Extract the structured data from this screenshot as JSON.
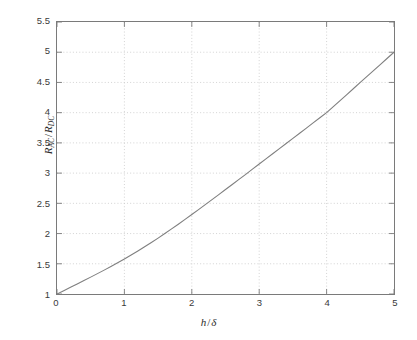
{
  "chart_data": {
    "type": "line",
    "title": "",
    "subtitle": "",
    "xlabel": "h / δ",
    "ylabel": "R_AC / R_DC",
    "xlabel_parts": {
      "var": "h",
      "slash": "/",
      "denom": "δ"
    },
    "ylabel_parts": {
      "num_base": "R",
      "num_sub": "AC",
      "slash": "/",
      "den_base": "R",
      "den_sub": "DC"
    },
    "xlim": [
      0,
      5
    ],
    "ylim": [
      1,
      5.5
    ],
    "xticks": [
      0,
      1,
      2,
      3,
      4,
      5
    ],
    "xtick_labels": [
      "0",
      "1",
      "2",
      "3",
      "4",
      "5"
    ],
    "yticks": [
      1,
      1.5,
      2,
      2.5,
      3,
      3.5,
      4,
      4.5,
      5,
      5.5
    ],
    "ytick_labels": [
      "1",
      "1.5",
      "2",
      "2.5",
      "3",
      "3.5",
      "4",
      "4.5",
      "5",
      "5.5"
    ],
    "grid": true,
    "grid_style": "dotted",
    "legend": null,
    "legend_position": "none",
    "series": [
      {
        "name": "R_AC/R_DC vs h/delta",
        "color": "#7f7f7f",
        "linewidth": 1.1,
        "x": [
          0.0,
          0.1,
          0.2,
          0.3,
          0.4,
          0.5,
          0.6,
          0.7,
          0.8,
          0.9,
          1.0,
          1.1,
          1.2,
          1.3,
          1.4,
          1.5,
          1.6,
          1.7,
          1.8,
          1.9,
          2.0,
          2.1,
          2.2,
          2.3,
          2.4,
          2.5,
          2.6,
          2.7,
          2.8,
          2.9,
          3.0,
          3.1,
          3.2,
          3.3,
          3.4,
          3.5,
          3.6,
          3.7,
          3.8,
          3.9,
          4.0,
          4.1,
          4.2,
          4.3,
          4.4,
          4.5,
          4.6,
          4.7,
          4.8,
          4.9,
          5.0
        ],
        "y": [
          1.0,
          1.055,
          1.11,
          1.166,
          1.222,
          1.279,
          1.337,
          1.395,
          1.455,
          1.516,
          1.58,
          1.645,
          1.712,
          1.781,
          1.852,
          1.925,
          2.0,
          2.077,
          2.155,
          2.234,
          2.315,
          2.396,
          2.478,
          2.561,
          2.644,
          2.728,
          2.812,
          2.896,
          2.98,
          3.065,
          3.15,
          3.235,
          3.32,
          3.405,
          3.49,
          3.575,
          3.66,
          3.745,
          3.83,
          3.915,
          4.0,
          4.1,
          4.2,
          4.3,
          4.4,
          4.5,
          4.6,
          4.7,
          4.8,
          4.9,
          5.0
        ]
      }
    ],
    "annotations": [],
    "notable_points": [
      {
        "x": 0,
        "y": 1.0,
        "note": "curve origin"
      },
      {
        "x": 0.9,
        "y": 1.5,
        "note": "crosses 1.5 gridline"
      },
      {
        "x": 1.6,
        "y": 2.0,
        "note": "crosses 2.0 gridline"
      },
      {
        "x": 2.3,
        "y": 2.56,
        "note": "mid-rise"
      },
      {
        "x": 3.0,
        "y": 3.15,
        "note": "crosses near 3.15"
      },
      {
        "x": 4.0,
        "y": 4.0,
        "note": "crosses 4.0 gridline"
      },
      {
        "x": 5.0,
        "y": 5.0,
        "note": "curve endpoint"
      }
    ]
  },
  "figure": {
    "background": "#ffffff",
    "axes_color": "#7a7a7a",
    "grid_color": "#c8c8c8",
    "tick_label_color": "#3a3a3a",
    "line_color": "#7f7f7f"
  }
}
